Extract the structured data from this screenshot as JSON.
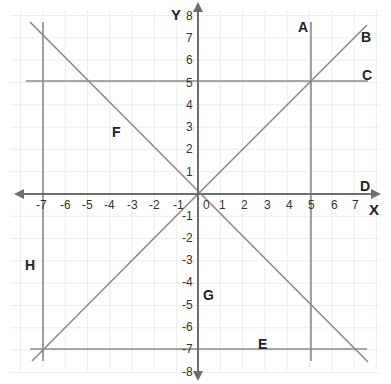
{
  "diagram": {
    "type": "coordinate-plane",
    "axes": {
      "x_label": "X",
      "y_label": "Y",
      "x_ticks": [
        "-7",
        "-6",
        "-5",
        "-4",
        "-3",
        "-2",
        "-1",
        "0",
        "1",
        "2",
        "3",
        "4",
        "5",
        "6",
        "7"
      ],
      "y_ticks_positive": [
        "1",
        "2",
        "3",
        "4",
        "5",
        "6",
        "7",
        "8"
      ],
      "y_ticks_negative": [
        "-1",
        "-2",
        "-3",
        "-4",
        "-5",
        "-6",
        "-7",
        "-8"
      ]
    },
    "lines": [
      {
        "label": "A",
        "equation": "x = 5"
      },
      {
        "label": "B",
        "equation": "y = x"
      },
      {
        "label": "C",
        "equation": "y = 5"
      },
      {
        "label": "D",
        "equation": "y = 0"
      },
      {
        "label": "E",
        "equation": "y = -7"
      },
      {
        "label": "F",
        "equation": "y = -x"
      },
      {
        "label": "G",
        "equation": "x = 0"
      },
      {
        "label": "H",
        "equation": "x = -7"
      }
    ],
    "colors": {
      "axis": "#6e6e6e",
      "line": "#8a8a8a",
      "grid": "#ececec",
      "text": "#222222"
    }
  }
}
